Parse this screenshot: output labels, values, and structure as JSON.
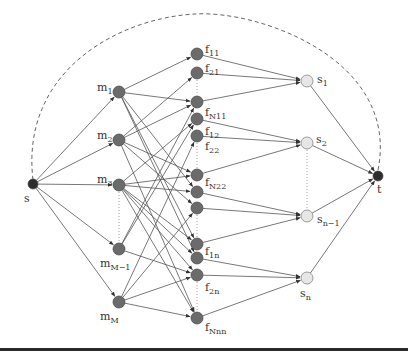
{
  "diagram": {
    "type": "flow-network",
    "colors": {
      "edge": "#555555",
      "dark_node": "#6b6b6b",
      "light_node": "#e6e6e6",
      "terminal_node": "#2e2e2e",
      "dashed": "#666666"
    },
    "nodes": [
      {
        "id": "s",
        "label": "s",
        "sub": "",
        "x": 33,
        "y": 184,
        "r": 5,
        "kind": "terminal",
        "lx": 24,
        "ly": 193
      },
      {
        "id": "m1",
        "label": "m",
        "sub": "1",
        "x": 119,
        "y": 92,
        "r": 6,
        "kind": "dark",
        "lx": 97,
        "ly": 82
      },
      {
        "id": "m2",
        "label": "m",
        "sub": "2",
        "x": 119,
        "y": 140,
        "r": 6,
        "kind": "dark",
        "lx": 97,
        "ly": 130
      },
      {
        "id": "m3",
        "label": "m",
        "sub": "3",
        "x": 119,
        "y": 185,
        "r": 6,
        "kind": "dark",
        "lx": 97,
        "ly": 174
      },
      {
        "id": "mM-1",
        "label": "m",
        "sub": "M−1",
        "x": 119,
        "y": 249,
        "r": 6,
        "kind": "dark",
        "lx": 100,
        "ly": 258
      },
      {
        "id": "mM",
        "label": "m",
        "sub": "M",
        "x": 119,
        "y": 302,
        "r": 6,
        "kind": "dark",
        "lx": 100,
        "ly": 311
      },
      {
        "id": "f11",
        "label": "f",
        "sub": "11",
        "x": 197,
        "y": 54,
        "r": 6,
        "kind": "dark",
        "lx": 205,
        "ly": 44
      },
      {
        "id": "f21",
        "label": "f",
        "sub": "21",
        "x": 197,
        "y": 73,
        "r": 6,
        "kind": "dark",
        "lx": 205,
        "ly": 63
      },
      {
        "id": "fN11",
        "label": "f",
        "sub": "N11",
        "x": 197,
        "y": 102,
        "r": 6,
        "kind": "dark",
        "lx": 205,
        "ly": 107
      },
      {
        "id": "f12",
        "label": "f",
        "sub": "12",
        "x": 197,
        "y": 119,
        "r": 6,
        "kind": "dark",
        "lx": 205,
        "ly": 126
      },
      {
        "id": "f22",
        "label": "f",
        "sub": "22",
        "x": 197,
        "y": 136,
        "r": 6,
        "kind": "dark",
        "lx": 205,
        "ly": 141
      },
      {
        "id": "fN22",
        "label": "f",
        "sub": "N22",
        "x": 197,
        "y": 175,
        "r": 6,
        "kind": "dark",
        "lx": 205,
        "ly": 177
      },
      {
        "id": "fa",
        "label": "",
        "sub": "",
        "x": 197,
        "y": 192,
        "r": 6,
        "kind": "dark",
        "lx": 0,
        "ly": 0
      },
      {
        "id": "fb",
        "label": "",
        "sub": "",
        "x": 197,
        "y": 208,
        "r": 6,
        "kind": "dark",
        "lx": 0,
        "ly": 0
      },
      {
        "id": "f1n",
        "label": "f",
        "sub": "1n",
        "x": 197,
        "y": 244,
        "r": 6,
        "kind": "dark",
        "lx": 205,
        "ly": 246
      },
      {
        "id": "fc",
        "label": "",
        "sub": "",
        "x": 197,
        "y": 258,
        "r": 6,
        "kind": "dark",
        "lx": 0,
        "ly": 0
      },
      {
        "id": "f2n",
        "label": "f",
        "sub": "2n",
        "x": 197,
        "y": 275,
        "r": 6,
        "kind": "dark",
        "lx": 205,
        "ly": 282
      },
      {
        "id": "fNnn",
        "label": "f",
        "sub": "Nnn",
        "x": 197,
        "y": 318,
        "r": 6,
        "kind": "dark",
        "lx": 205,
        "ly": 322
      },
      {
        "id": "s1",
        "label": "s",
        "sub": "1",
        "x": 307,
        "y": 81,
        "r": 6,
        "kind": "light",
        "lx": 317,
        "ly": 74
      },
      {
        "id": "s2",
        "label": "s",
        "sub": "2",
        "x": 307,
        "y": 143,
        "r": 6,
        "kind": "light",
        "lx": 316,
        "ly": 134
      },
      {
        "id": "sn-1",
        "label": "s",
        "sub": "n−1",
        "x": 307,
        "y": 216,
        "r": 6,
        "kind": "light",
        "lx": 317,
        "ly": 214
      },
      {
        "id": "sn",
        "label": "s",
        "sub": "n",
        "x": 307,
        "y": 278,
        "r": 6,
        "kind": "light",
        "lx": 300,
        "ly": 288
      },
      {
        "id": "t",
        "label": "t",
        "sub": "",
        "x": 378,
        "y": 176,
        "r": 5,
        "kind": "terminal",
        "lx": 377,
        "ly": 184
      }
    ],
    "edges": [
      [
        "s",
        "m1"
      ],
      [
        "s",
        "m2"
      ],
      [
        "s",
        "m3"
      ],
      [
        "s",
        "mM-1"
      ],
      [
        "s",
        "mM"
      ],
      [
        "m1",
        "f11"
      ],
      [
        "m1",
        "fN11"
      ],
      [
        "m1",
        "fa"
      ],
      [
        "m1",
        "f1n"
      ],
      [
        "m1",
        "fc"
      ],
      [
        "m2",
        "f21"
      ],
      [
        "m2",
        "fN11"
      ],
      [
        "m2",
        "fN22"
      ],
      [
        "m2",
        "fb"
      ],
      [
        "m2",
        "fNnn"
      ],
      [
        "m3",
        "f12"
      ],
      [
        "m3",
        "fa"
      ],
      [
        "m3",
        "fN22"
      ],
      [
        "m3",
        "f1n"
      ],
      [
        "m3",
        "fc"
      ],
      [
        "m3",
        "f2n"
      ],
      [
        "m3",
        "fNnn"
      ],
      [
        "mM-1",
        "fN11"
      ],
      [
        "mM-1",
        "f12"
      ],
      [
        "mM-1",
        "f2n"
      ],
      [
        "mM",
        "f22"
      ],
      [
        "mM",
        "fb"
      ],
      [
        "mM",
        "f2n"
      ],
      [
        "mM",
        "fNnn"
      ],
      [
        "f11",
        "s1"
      ],
      [
        "f21",
        "s1"
      ],
      [
        "fN11",
        "s1"
      ],
      [
        "f12",
        "s2"
      ],
      [
        "f22",
        "s2"
      ],
      [
        "fN22",
        "s2"
      ],
      [
        "fa",
        "sn-1"
      ],
      [
        "fb",
        "sn-1"
      ],
      [
        "f1n",
        "sn-1"
      ],
      [
        "fc",
        "sn"
      ],
      [
        "f2n",
        "sn"
      ],
      [
        "fNnn",
        "sn"
      ],
      [
        "s1",
        "t"
      ],
      [
        "s2",
        "t"
      ],
      [
        "sn-1",
        "t"
      ],
      [
        "sn",
        "t"
      ]
    ],
    "dotted_links": [
      [
        "f21",
        "fN11"
      ],
      [
        "f22",
        "fN22"
      ],
      [
        "fb",
        "f1n"
      ],
      [
        "f2n",
        "fNnn"
      ],
      [
        "m3",
        "mM-1"
      ],
      [
        "s2",
        "sn-1"
      ]
    ],
    "return_arc": {
      "from": "t",
      "to": "s",
      "style": "dashed",
      "path": "M378 170 C 400 60, 260 10, 195 14 C 120 18, 20 70, 33 180"
    }
  }
}
